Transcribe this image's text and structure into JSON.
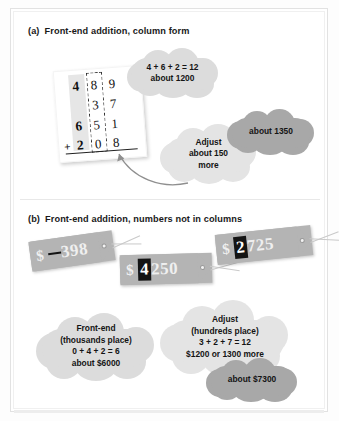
{
  "figure": {
    "panels": [
      {
        "id": "a",
        "label": "(a)",
        "title": "Front-end addition, column form"
      },
      {
        "id": "b",
        "label": "(b)",
        "title": "Front-end addition, numbers not in columns"
      }
    ]
  },
  "column_form": {
    "caption": "Column addition problem with hundreds column shaded and tens column outlined by a dashed box",
    "rows": [
      {
        "operator": "",
        "hundreds": "4",
        "tens": "8",
        "ones": "9"
      },
      {
        "operator": "",
        "hundreds": "",
        "tens": "3",
        "ones": "7"
      },
      {
        "operator": "",
        "hundreds": "6",
        "tens": "5",
        "ones": "1"
      },
      {
        "operator": "+",
        "hundreds": "2",
        "tens": "0",
        "ones": "8"
      }
    ]
  },
  "panel_a_clouds": {
    "front_end": "4 + 6 + 2 = 12\nabout 1200",
    "adjust": "Adjust\nabout 150\nmore",
    "answer": "about 1350"
  },
  "price_tags": [
    {
      "name": "tag-398",
      "currency": "$",
      "highlight": " ",
      "rest": "398",
      "full_value": "$398"
    },
    {
      "name": "tag-4250",
      "currency": "$",
      "highlight": "4",
      "rest": "250",
      "full_value": "$4250"
    },
    {
      "name": "tag-2725",
      "currency": "$",
      "highlight": "2",
      "rest": "725",
      "full_value": "$2725"
    }
  ],
  "panel_b_clouds": {
    "front_end": "Front-end\n(thousands place)\n0 + 4 + 2 = 6\nabout $6000",
    "adjust": "Adjust\n(hundreds place)\n3 + 2 + 7 = 12\n$1200 or 1300 more",
    "answer": "about $7300"
  },
  "colors": {
    "cloud_light": "#dcdcdc",
    "cloud_dark": "#a8a8a8",
    "tag_gray": "#b4b4b4",
    "highlight_black": "#141414",
    "text": "#141414"
  }
}
